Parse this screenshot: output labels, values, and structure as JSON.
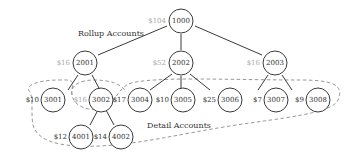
{
  "diagram": {
    "labels": {
      "rollup": "Rollup Accounts",
      "detail": "Detail Accounts"
    },
    "colors": {
      "stroke": "#3a3a3a",
      "dashed": "#8c8c8c",
      "muted_amount": "#a8a8a8",
      "text": "#333333"
    },
    "nodes": [
      {
        "id": "1000",
        "amount": "$104",
        "amount_muted": true,
        "level": "rollup"
      },
      {
        "id": "2001",
        "amount": "$16",
        "amount_muted": true,
        "level": "rollup"
      },
      {
        "id": "2002",
        "amount": "$52",
        "amount_muted": true,
        "level": "rollup"
      },
      {
        "id": "2003",
        "amount": "$16",
        "amount_muted": true,
        "level": "rollup"
      },
      {
        "id": "3001",
        "amount": "$10",
        "amount_muted": false,
        "level": "detail"
      },
      {
        "id": "3002",
        "amount": "$16",
        "amount_muted": true,
        "level": "rollup"
      },
      {
        "id": "3004",
        "amount": "$17",
        "amount_muted": false,
        "level": "detail"
      },
      {
        "id": "3005",
        "amount": "$10",
        "amount_muted": false,
        "level": "detail"
      },
      {
        "id": "3006",
        "amount": "$25",
        "amount_muted": false,
        "level": "detail"
      },
      {
        "id": "3007",
        "amount": "$7",
        "amount_muted": false,
        "level": "detail"
      },
      {
        "id": "3008",
        "amount": "$9",
        "amount_muted": false,
        "level": "detail"
      },
      {
        "id": "4001",
        "amount": "$12",
        "amount_muted": false,
        "level": "detail"
      },
      {
        "id": "4002",
        "amount": "$14",
        "amount_muted": false,
        "level": "detail"
      }
    ],
    "edges": [
      [
        "1000",
        "2001"
      ],
      [
        "1000",
        "2002"
      ],
      [
        "1000",
        "2003"
      ],
      [
        "2001",
        "3001"
      ],
      [
        "2001",
        "3002"
      ],
      [
        "3002",
        "4001"
      ],
      [
        "3002",
        "4002"
      ],
      [
        "2002",
        "3004"
      ],
      [
        "2002",
        "3005"
      ],
      [
        "2002",
        "3006"
      ],
      [
        "2003",
        "3007"
      ],
      [
        "2003",
        "3008"
      ]
    ]
  }
}
